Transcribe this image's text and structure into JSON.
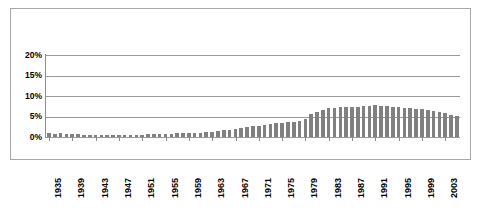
{
  "chart_data": {
    "type": "bar",
    "title": "",
    "xlabel": "",
    "ylabel": "",
    "ylim": [
      0,
      20
    ],
    "yticks": [
      0,
      5,
      10,
      15,
      20
    ],
    "ytick_labels": [
      "0%",
      "5%",
      "10%",
      "15%",
      "20%"
    ],
    "grid": true,
    "legend": "none",
    "series_name": "",
    "bar_color": "#808080",
    "categories": [
      "1935",
      "1936",
      "1937",
      "1938",
      "1939",
      "1940",
      "1941",
      "1942",
      "1943",
      "1944",
      "1945",
      "1946",
      "1947",
      "1948",
      "1949",
      "1950",
      "1951",
      "1952",
      "1953",
      "1954",
      "1955",
      "1956",
      "1957",
      "1958",
      "1959",
      "1960",
      "1961",
      "1962",
      "1963",
      "1964",
      "1965",
      "1966",
      "1967",
      "1968",
      "1969",
      "1970",
      "1971",
      "1972",
      "1973",
      "1974",
      "1975",
      "1976",
      "1977",
      "1978",
      "1979",
      "1980",
      "1981",
      "1982",
      "1983",
      "1984",
      "1985",
      "1986",
      "1987",
      "1988",
      "1989",
      "1990",
      "1991",
      "1992",
      "1993",
      "1994",
      "1995",
      "1996",
      "1997",
      "1998",
      "1999",
      "2000",
      "2001",
      "2002",
      "2003",
      "2004",
      "2005"
    ],
    "values": [
      0.9,
      0.8,
      0.9,
      0.8,
      0.8,
      0.7,
      0.6,
      0.5,
      0.5,
      0.5,
      0.5,
      0.5,
      0.5,
      0.6,
      0.6,
      0.6,
      0.6,
      0.7,
      0.7,
      0.7,
      0.8,
      0.8,
      0.9,
      0.9,
      0.9,
      1.0,
      1.1,
      1.2,
      1.3,
      1.5,
      1.6,
      1.8,
      2.0,
      2.2,
      2.4,
      2.6,
      2.8,
      3.0,
      3.2,
      3.4,
      3.5,
      3.6,
      3.7,
      3.8,
      4.5,
      5.5,
      6.2,
      6.6,
      7.0,
      7.1,
      7.2,
      7.4,
      7.3,
      7.4,
      7.5,
      7.5,
      7.9,
      7.6,
      7.5,
      7.3,
      7.2,
      7.1,
      7.0,
      6.9,
      6.9,
      6.7,
      6.4,
      6.2,
      5.8,
      5.4,
      5.2
    ],
    "xtick_labels": [
      "1935",
      "1939",
      "1943",
      "1947",
      "1951",
      "1955",
      "1959",
      "1963",
      "1967",
      "1971",
      "1975",
      "1979",
      "1983",
      "1987",
      "1991",
      "1995",
      "1999",
      "2003"
    ],
    "xtick_indices": [
      0,
      4,
      8,
      12,
      16,
      20,
      24,
      28,
      32,
      36,
      40,
      44,
      48,
      52,
      56,
      60,
      64,
      68
    ]
  }
}
